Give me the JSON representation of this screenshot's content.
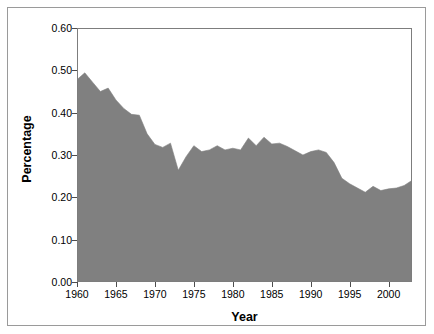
{
  "chart_data": {
    "type": "area",
    "title": "",
    "xlabel": "Year",
    "ylabel": "Percentage",
    "xlim": [
      1960,
      2003
    ],
    "ylim": [
      0.0,
      0.6
    ],
    "grid": false,
    "legend": null,
    "series_color": "#808080",
    "axis_color": "#7d7d7d",
    "frame_color": "#9a9a9a",
    "background": "#ffffff",
    "ytick_labels": [
      "0.00",
      "0.10",
      "0.20",
      "0.30",
      "0.40",
      "0.50",
      "0.60"
    ],
    "ytick_values": [
      0.0,
      0.1,
      0.2,
      0.3,
      0.4,
      0.5,
      0.6
    ],
    "xtick_labels": [
      "1960",
      "1965",
      "1970",
      "1975",
      "1980",
      "1985",
      "1990",
      "1995",
      "2000"
    ],
    "xtick_values": [
      1960,
      1965,
      1970,
      1975,
      1980,
      1985,
      1990,
      1995,
      2000
    ],
    "x": [
      1960,
      1961,
      1962,
      1963,
      1964,
      1965,
      1966,
      1967,
      1968,
      1969,
      1970,
      1971,
      1972,
      1973,
      1974,
      1975,
      1976,
      1977,
      1978,
      1979,
      1980,
      1981,
      1982,
      1983,
      1984,
      1985,
      1986,
      1987,
      1988,
      1989,
      1990,
      1991,
      1992,
      1993,
      1994,
      1995,
      1996,
      1997,
      1998,
      1999,
      2000,
      2001,
      2002,
      2003
    ],
    "values": [
      0.478,
      0.494,
      0.472,
      0.45,
      0.458,
      0.43,
      0.41,
      0.396,
      0.394,
      0.35,
      0.325,
      0.318,
      0.328,
      0.264,
      0.296,
      0.322,
      0.308,
      0.312,
      0.322,
      0.312,
      0.316,
      0.312,
      0.34,
      0.322,
      0.342,
      0.326,
      0.328,
      0.32,
      0.31,
      0.3,
      0.308,
      0.312,
      0.306,
      0.282,
      0.245,
      0.232,
      0.222,
      0.212,
      0.226,
      0.216,
      0.22,
      0.222,
      0.228,
      0.24
    ]
  },
  "axes": {
    "ylabel_text": "Percentage",
    "xlabel_text": "Year"
  }
}
